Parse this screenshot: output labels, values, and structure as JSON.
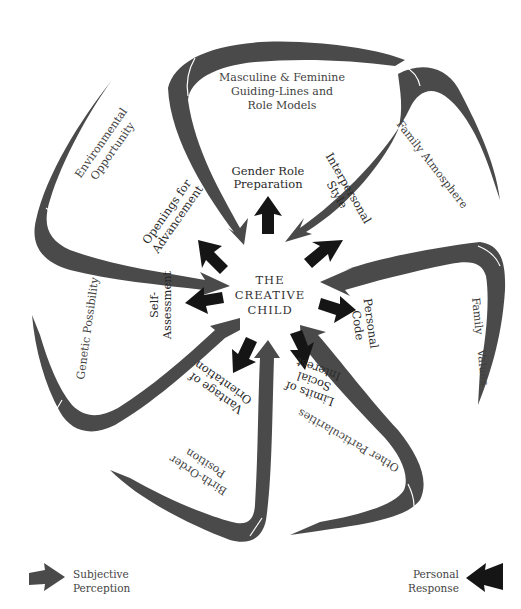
{
  "diagram": {
    "center_label": [
      "THE",
      "CREATIVE",
      "CHILD"
    ],
    "outer_influences": [
      {
        "lines": [
          "Masculine & Feminine",
          "Guiding-Lines and",
          "Role Models"
        ]
      },
      {
        "lines": [
          "Family Atmosphere"
        ]
      },
      {
        "lines": [
          "Family",
          "Values"
        ]
      },
      {
        "lines": [
          "Other Particularities"
        ]
      },
      {
        "lines": [
          "Birth-Order",
          "Position"
        ]
      },
      {
        "lines": [
          "Genetic Possibility"
        ]
      },
      {
        "lines": [
          "Environmental",
          "Opportunity"
        ]
      }
    ],
    "inner_responses": [
      {
        "lines": [
          "Gender Role",
          "Preparation"
        ]
      },
      {
        "lines": [
          "Interpersonal",
          "Style"
        ]
      },
      {
        "lines": [
          "Personal",
          "Code"
        ]
      },
      {
        "lines": [
          "Limits of",
          "Social",
          "Interest"
        ]
      },
      {
        "lines": [
          "Vantage of",
          "Orientation"
        ]
      },
      {
        "lines": [
          "Self-",
          "Assessment"
        ]
      },
      {
        "lines": [
          "Openings for",
          "Advancement"
        ]
      }
    ],
    "colors": {
      "perception": "#4a4a4a",
      "response": "#151515"
    }
  },
  "legend": {
    "left": {
      "line1": "Subjective",
      "line2": "Perception"
    },
    "right": {
      "line1": "Personal",
      "line2": "Response"
    }
  }
}
